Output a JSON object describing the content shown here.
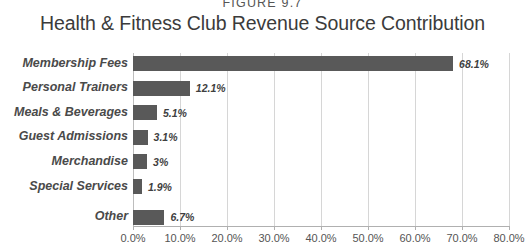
{
  "figure": {
    "number_label": "FIGURE 9.7",
    "title": "Health & Fitness Club Revenue Source Contribution"
  },
  "colors": {
    "bar": "#595959",
    "gridline": "#d6d6d6",
    "axis": "#b0b0b0",
    "title_text": "#3b3b3b",
    "label_text": "#4a4a4a",
    "background": "#ffffff"
  },
  "chart_data": {
    "type": "bar",
    "orientation": "horizontal",
    "title": "Health & Fitness Club Revenue Source Contribution",
    "xlabel": "",
    "ylabel": "",
    "xlim": [
      0,
      80
    ],
    "grid": true,
    "legend": false,
    "categories": [
      "Membership Fees",
      "Personal Trainers",
      "Meals & Beverages",
      "Guest Admissions",
      "Merchandise",
      "Special Services",
      "Other"
    ],
    "values": [
      68.1,
      12.1,
      5.1,
      3.1,
      3,
      1.9,
      6.7
    ],
    "data_labels": [
      "68.1%",
      "12.1%",
      "5.1%",
      "3.1%",
      "3%",
      "1.9%",
      "6.7%"
    ],
    "xticks": [
      0,
      10,
      20,
      30,
      40,
      50,
      60,
      70,
      80
    ],
    "xtick_labels": [
      "0.0%",
      "10.0%",
      "20.0%",
      "30.0%",
      "40.0%",
      "50.0%",
      "60.0%",
      "70.0%",
      "80.0%"
    ]
  }
}
